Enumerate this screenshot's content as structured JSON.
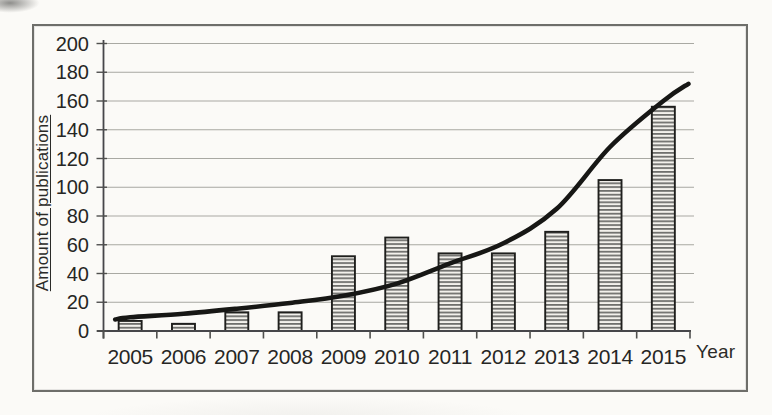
{
  "chart_data": {
    "type": "bar",
    "title": "",
    "categories": [
      "2005",
      "2006",
      "2007",
      "2008",
      "2009",
      "2010",
      "2011",
      "2012",
      "2013",
      "2014",
      "2015"
    ],
    "series": [
      {
        "name": "Amount of publications",
        "type": "bar",
        "values": [
          7,
          5,
          13,
          13,
          52,
          65,
          54,
          54,
          69,
          105,
          156
        ]
      },
      {
        "name": "Exponential trend line",
        "type": "line",
        "points_category_value": [
          [
            -0.28,
            8
          ],
          [
            0,
            9.5
          ],
          [
            1,
            12
          ],
          [
            2,
            15.5
          ],
          [
            3,
            19.5
          ],
          [
            4,
            24.5
          ],
          [
            5,
            33
          ],
          [
            6,
            47
          ],
          [
            7,
            61
          ],
          [
            8,
            85
          ],
          [
            9,
            128
          ],
          [
            10,
            160
          ],
          [
            10.47,
            172
          ]
        ]
      }
    ],
    "xlabel": "Year",
    "ylabel": "Amount of publications",
    "ylim": [
      0,
      200
    ],
    "ytick_step": 20,
    "ytick_labels": [
      "0",
      "20",
      "40",
      "60",
      "80",
      "100",
      "120",
      "140",
      "160",
      "180",
      "200"
    ],
    "grid": true,
    "legend": false,
    "bar_style": "horizontal-line-hatch",
    "colors": {
      "background": "#fbfaf7",
      "frame_border": "#6e6e6a",
      "grid": "#9b9b95",
      "axis": "#46464a",
      "tick": "#50504e",
      "bar_fill": "#f3f1ec",
      "bar_hatch": "#3f3f3d",
      "bar_border": "#1f1f1d",
      "trend": "#171715",
      "text": "#262624"
    }
  }
}
